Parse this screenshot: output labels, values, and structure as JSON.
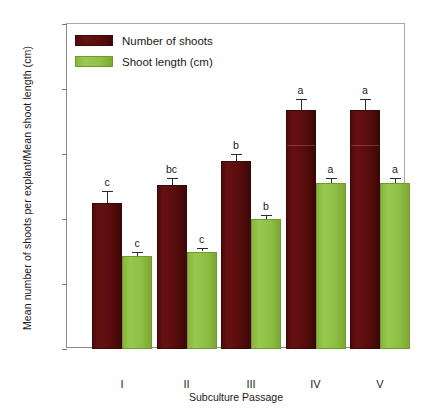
{
  "chart_data": {
    "type": "bar",
    "title": "",
    "xlabel": "Subculture Passage",
    "ylabel": "Mean number of shoots per explant/Mean shoot length (cm)",
    "categories": [
      "I",
      "II",
      "III",
      "IV",
      "V"
    ],
    "ylim": [
      0,
      10
    ],
    "yticks": [
      0,
      2,
      4,
      6,
      8,
      10
    ],
    "ytick_labels": [
      "0",
      "2",
      "4",
      "6",
      "8",
      "10"
    ],
    "grid": false,
    "legend_position": "top-left",
    "series": [
      {
        "name": "Number of shoots",
        "color": "#5A0D0D",
        "values": [
          4.5,
          5.05,
          5.8,
          7.35,
          7.35
        ],
        "errors": [
          0.35,
          0.2,
          0.2,
          0.35,
          0.35
        ],
        "sig_letters": [
          "c",
          "bc",
          "b",
          "a",
          "a"
        ]
      },
      {
        "name": "Shoot length (cm)",
        "color": "#8EBF43",
        "values": [
          2.85,
          3.0,
          4.0,
          5.1,
          5.1
        ],
        "errors": [
          0.15,
          0.12,
          0.12,
          0.15,
          0.15
        ],
        "sig_letters": [
          "c",
          "c",
          "b",
          "a",
          "a"
        ]
      }
    ]
  },
  "axis": {
    "y_title": "Mean number of shoots per explant/Mean shoot length (cm)",
    "x_title": "Subculture Passage",
    "y_ticks": [
      "10",
      "8",
      "6",
      "4",
      "2",
      "0"
    ],
    "x_ticks": [
      "I",
      "II",
      "III",
      "IV",
      "V"
    ]
  },
  "legend": {
    "items": [
      {
        "label": "Number of shoots",
        "swatch": "dark-maroon-swatch"
      },
      {
        "label": "Shoot length (cm)",
        "swatch": "olive-green-swatch"
      }
    ]
  }
}
